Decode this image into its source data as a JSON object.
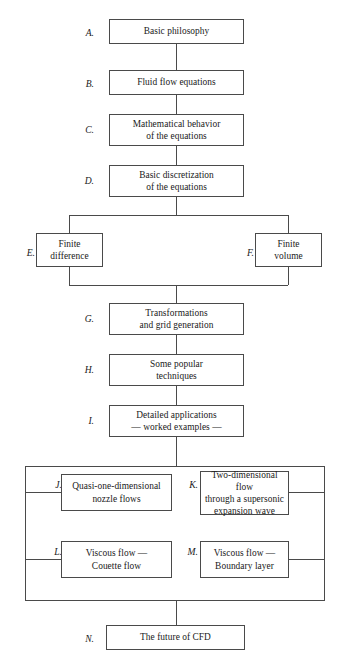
{
  "diagram": {
    "nodes": [
      {
        "key": "A",
        "label": "A.",
        "lines": [
          "Basic philosophy"
        ]
      },
      {
        "key": "B",
        "label": "B.",
        "lines": [
          "Fluid flow equations"
        ]
      },
      {
        "key": "C",
        "label": "C.",
        "lines": [
          "Mathematical behavior",
          "of the equations"
        ]
      },
      {
        "key": "D",
        "label": "D.",
        "lines": [
          "Basic discretization",
          "of the equations"
        ]
      },
      {
        "key": "E",
        "label": "E.",
        "lines": [
          "Finite",
          "difference"
        ]
      },
      {
        "key": "F",
        "label": "F.",
        "lines": [
          "Finite",
          "volume"
        ]
      },
      {
        "key": "G",
        "label": "G.",
        "lines": [
          "Transformations",
          "and grid generation"
        ]
      },
      {
        "key": "H",
        "label": "H.",
        "lines": [
          "Some popular",
          "techniques"
        ]
      },
      {
        "key": "I",
        "label": "I.",
        "lines": [
          "Detailed applications",
          "— worked examples —"
        ]
      },
      {
        "key": "J",
        "label": "J.",
        "lines": [
          "Quasi-one-dimensional",
          "nozzle flows"
        ]
      },
      {
        "key": "K",
        "label": "K.",
        "lines": [
          "Two-dimensional flow",
          "through a supersonic",
          "expansion wave"
        ]
      },
      {
        "key": "L",
        "label": "L.",
        "lines": [
          "Viscous flow —",
          "Couette flow"
        ]
      },
      {
        "key": "M",
        "label": "M.",
        "lines": [
          "Viscous flow —",
          "Boundary layer"
        ]
      },
      {
        "key": "N",
        "label": "N.",
        "lines": [
          "The future of CFD"
        ]
      }
    ],
    "colors": {
      "stroke": "#4a4a4a",
      "text": "#1a1a1a",
      "background": "#ffffff"
    }
  }
}
